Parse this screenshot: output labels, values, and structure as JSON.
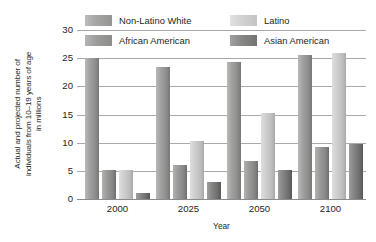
{
  "chart_data": {
    "type": "bar",
    "title": "",
    "xlabel": "Year",
    "ylabel": "Actual and projected number of\nindividuals from 10–19 years of age\nin millions",
    "categories": [
      "2000",
      "2025",
      "2050",
      "2100"
    ],
    "yticks": [
      "30",
      "25",
      "20",
      "15",
      "10",
      "5",
      "0"
    ],
    "ylim": [
      0,
      30
    ],
    "grid": true,
    "legend_position": "top",
    "series": [
      {
        "name": "Non-Latino White",
        "color": "#a3a3a1",
        "values": [
          25.0,
          23.5,
          24.4,
          25.6
        ]
      },
      {
        "name": "African American",
        "color": "#9c9c9a",
        "values": [
          5.2,
          6.0,
          6.8,
          9.3
        ]
      },
      {
        "name": "Latino",
        "color": "#cfcfcf",
        "values": [
          5.2,
          10.3,
          15.2,
          26.0
        ]
      },
      {
        "name": "Asian American",
        "color": "#878785",
        "values": [
          1.1,
          3.0,
          5.2,
          9.7
        ]
      }
    ]
  },
  "legend": {
    "items": [
      {
        "label": "Non-Latino White",
        "swatch": "c0"
      },
      {
        "label": "Latino",
        "swatch": "c2"
      },
      {
        "label": "African American",
        "swatch": "c1"
      },
      {
        "label": "Asian American",
        "swatch": "c3"
      }
    ]
  },
  "axes": {
    "y_title": "Actual and projected number of\nindividuals from 10–19 years of age\nin millions",
    "x_title": "Year",
    "y_ticks": [
      "30",
      "25",
      "20",
      "15",
      "10",
      "5",
      "0"
    ],
    "x_ticks": [
      "2000",
      "2025",
      "2050",
      "2100"
    ]
  }
}
